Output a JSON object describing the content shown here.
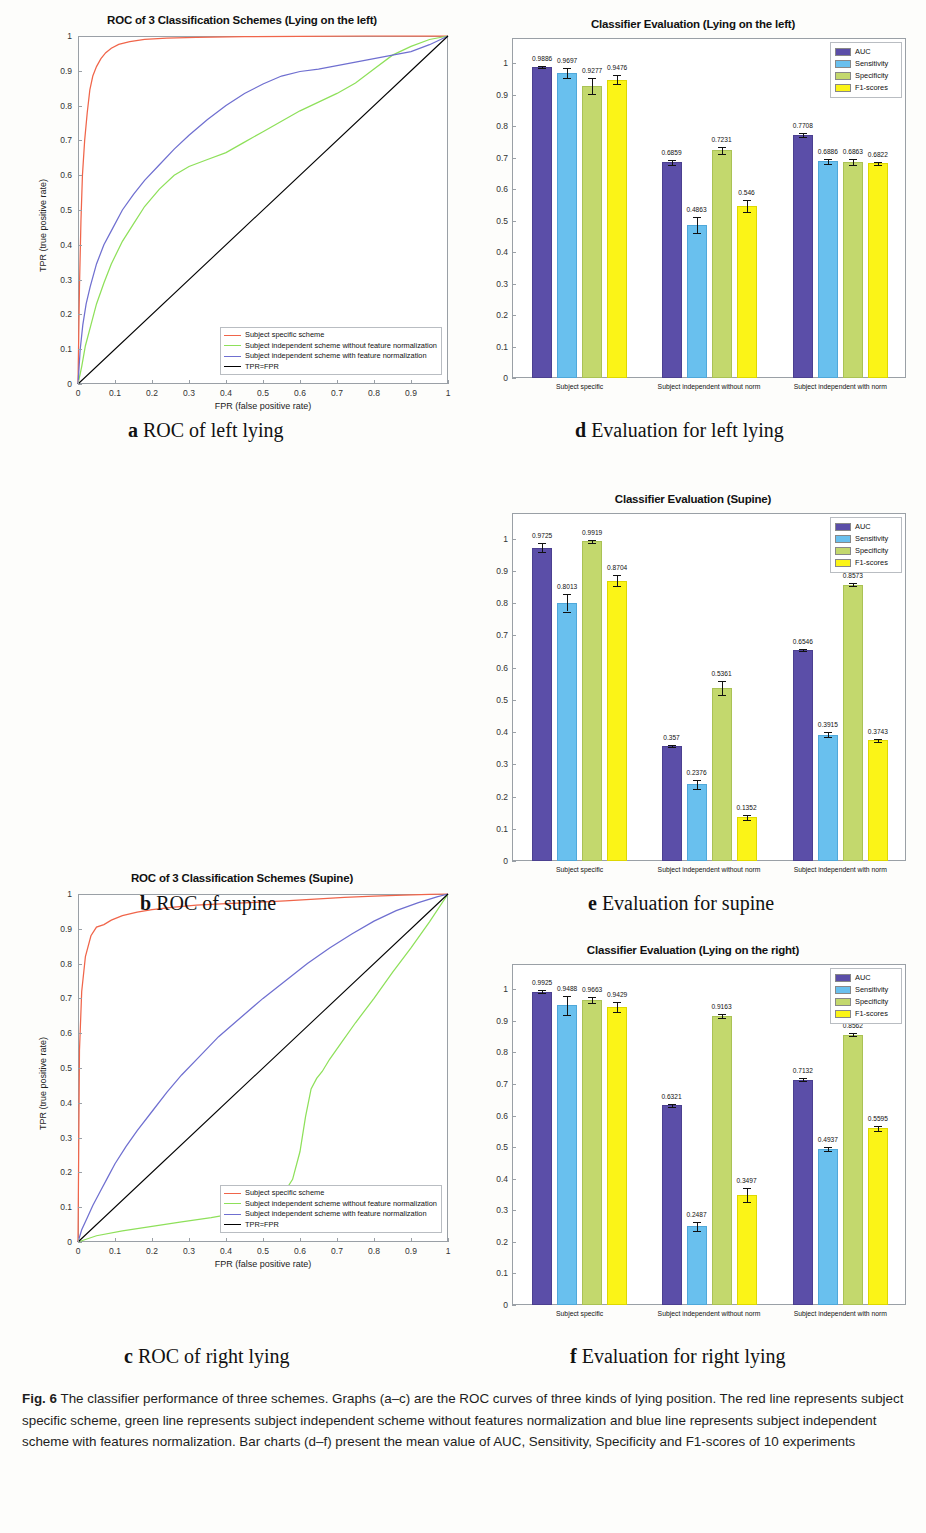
{
  "figure": {
    "caption_label": "Fig. 6",
    "caption_text": " The classifier performance of three schemes. Graphs (a–c) are the ROC curves of three kinds of lying position. The red line represents subject specific scheme, green line represents subject independent scheme without features normalization and blue line represents subject independent scheme with features normalization. Bar charts (d–f) present the mean value of AUC, Sensitivity, Specificity and F1-scores of 10 experiments"
  },
  "subcaptions": {
    "a_letter": "a",
    "a_text": " ROC of left lying",
    "b_letter": "b",
    "b_text": " ROC of supine",
    "c_letter": "c",
    "c_text": " ROC of right lying",
    "d_letter": "d",
    "d_text": " Evaluation for left lying",
    "e_letter": "e",
    "e_text": " Evaluation for supine",
    "f_letter": "f",
    "f_text": " Evaluation for right lying"
  },
  "colors": {
    "subject_specific": "#f0654a",
    "independent_without_norm": "#8ee05a",
    "independent_with_norm": "#6f6fd0",
    "diagonal": "#000000",
    "auc": "#5b4ea8",
    "sensitivity": "#69c0ee",
    "specificity": "#c3d86d",
    "f1": "#fbf417"
  },
  "roc_common": {
    "xlabel": "FPR (false positive rate)",
    "ylabel": "TPR (true positive rate)",
    "xticks": [
      "0",
      "0.1",
      "0.2",
      "0.3",
      "0.4",
      "0.5",
      "0.6",
      "0.7",
      "0.8",
      "0.9",
      "1"
    ],
    "yticks": [
      "0",
      "0.1",
      "0.2",
      "0.3",
      "0.4",
      "0.5",
      "0.6",
      "0.7",
      "0.8",
      "0.9",
      "1"
    ],
    "legend": [
      {
        "label": "Subject specific scheme",
        "color": "#f0654a"
      },
      {
        "label": "Subject independent scheme without feature normalization",
        "color": "#8ee05a"
      },
      {
        "label": "Subject independent scheme with feature normalization",
        "color": "#6f6fd0"
      },
      {
        "label": "TPR=FPR",
        "color": "#000000"
      }
    ]
  },
  "bar_common": {
    "yticks": [
      "0",
      "0.1",
      "0.2",
      "0.3",
      "0.4",
      "0.5",
      "0.6",
      "0.7",
      "0.8",
      "0.9",
      "1"
    ],
    "groups": [
      "Subject specific",
      "Subject independent without norm",
      "Subject independent with norm"
    ],
    "legend": [
      {
        "label": "AUC",
        "color": "#5b4ea8"
      },
      {
        "label": "Sensitivity",
        "color": "#69c0ee"
      },
      {
        "label": "Specificity",
        "color": "#c3d86d"
      },
      {
        "label": "F1-scores",
        "color": "#fbf417"
      }
    ]
  },
  "chart_data": [
    {
      "id": "a",
      "type": "line",
      "title": "ROC of 3 Classification Schemes (Lying on the left)",
      "xlabel": "FPR (false positive rate)",
      "ylabel": "TPR (true positive rate)",
      "xlim": [
        0,
        1
      ],
      "ylim": [
        0,
        1
      ],
      "grid": false,
      "legend_position": "bottom-right",
      "series": [
        {
          "name": "Subject specific scheme",
          "color": "#f0654a",
          "x": [
            0,
            0.004,
            0.008,
            0.012,
            0.018,
            0.025,
            0.032,
            0.04,
            0.05,
            0.062,
            0.075,
            0.09,
            0.11,
            0.14,
            0.18,
            0.24,
            0.32,
            0.45,
            0.6,
            0.78,
            1.0
          ],
          "y": [
            0,
            0.28,
            0.47,
            0.6,
            0.7,
            0.78,
            0.845,
            0.885,
            0.912,
            0.935,
            0.952,
            0.965,
            0.976,
            0.984,
            0.99,
            0.994,
            0.996,
            0.998,
            0.999,
            1.0,
            1.0
          ]
        },
        {
          "name": "Subject independent scheme without feature normalization",
          "color": "#8ee05a",
          "x": [
            0,
            0.01,
            0.02,
            0.035,
            0.05,
            0.07,
            0.09,
            0.12,
            0.15,
            0.18,
            0.22,
            0.26,
            0.3,
            0.35,
            0.4,
            0.45,
            0.5,
            0.55,
            0.6,
            0.65,
            0.7,
            0.75,
            0.8,
            0.85,
            0.9,
            0.95,
            1.0
          ],
          "y": [
            0,
            0.05,
            0.11,
            0.17,
            0.23,
            0.29,
            0.345,
            0.41,
            0.46,
            0.51,
            0.56,
            0.6,
            0.625,
            0.645,
            0.665,
            0.695,
            0.725,
            0.755,
            0.785,
            0.81,
            0.835,
            0.865,
            0.905,
            0.945,
            0.97,
            0.99,
            1.0
          ]
        },
        {
          "name": "Subject independent scheme with feature normalization",
          "color": "#6f6fd0",
          "x": [
            0,
            0.006,
            0.013,
            0.022,
            0.033,
            0.05,
            0.07,
            0.09,
            0.12,
            0.15,
            0.18,
            0.22,
            0.26,
            0.3,
            0.35,
            0.4,
            0.45,
            0.5,
            0.55,
            0.6,
            0.65,
            0.7,
            0.75,
            0.8,
            0.85,
            0.9,
            0.95,
            1.0
          ],
          "y": [
            0,
            0.1,
            0.17,
            0.23,
            0.28,
            0.345,
            0.4,
            0.44,
            0.5,
            0.545,
            0.585,
            0.63,
            0.675,
            0.715,
            0.76,
            0.8,
            0.835,
            0.862,
            0.885,
            0.898,
            0.905,
            0.915,
            0.925,
            0.935,
            0.945,
            0.955,
            0.975,
            1.0
          ]
        },
        {
          "name": "TPR=FPR",
          "color": "#000000",
          "x": [
            0,
            1
          ],
          "y": [
            0,
            1
          ]
        }
      ]
    },
    {
      "id": "b",
      "type": "line",
      "title": "ROC of 3 Classification Schemes (Supine)",
      "xlabel": "FPR (false positive rate)",
      "ylabel": "TPR (true positive rate)",
      "xlim": [
        0,
        1
      ],
      "ylim": [
        0,
        1
      ],
      "grid": false,
      "legend_position": "bottom-right",
      "series": [
        {
          "name": "Subject specific scheme",
          "color": "#f0654a",
          "x": [
            0,
            0.004,
            0.01,
            0.02,
            0.035,
            0.05,
            0.07,
            0.09,
            0.12,
            0.16,
            0.2,
            0.26,
            0.32,
            0.4,
            0.48,
            0.56,
            0.64,
            0.72,
            0.8,
            0.88,
            0.95,
            1.0
          ],
          "y": [
            0,
            0.55,
            0.72,
            0.82,
            0.88,
            0.905,
            0.912,
            0.925,
            0.938,
            0.948,
            0.955,
            0.962,
            0.968,
            0.972,
            0.976,
            0.98,
            0.985,
            0.99,
            0.994,
            0.997,
            0.999,
            1.0
          ]
        },
        {
          "name": "Subject independent scheme without feature normalization",
          "color": "#8ee05a",
          "x": [
            0,
            0.05,
            0.12,
            0.2,
            0.28,
            0.36,
            0.44,
            0.5,
            0.55,
            0.58,
            0.6,
            0.615,
            0.63,
            0.645,
            0.66,
            0.68,
            0.71,
            0.75,
            0.8,
            0.85,
            0.9,
            0.95,
            1.0
          ],
          "y": [
            0,
            0.018,
            0.032,
            0.045,
            0.058,
            0.07,
            0.085,
            0.1,
            0.13,
            0.18,
            0.26,
            0.36,
            0.44,
            0.47,
            0.49,
            0.525,
            0.57,
            0.63,
            0.7,
            0.775,
            0.845,
            0.92,
            1.0
          ]
        },
        {
          "name": "Subject independent scheme with feature normalization",
          "color": "#6f6fd0",
          "x": [
            0,
            0.01,
            0.025,
            0.04,
            0.06,
            0.08,
            0.1,
            0.13,
            0.16,
            0.2,
            0.24,
            0.28,
            0.33,
            0.38,
            0.44,
            0.5,
            0.56,
            0.62,
            0.68,
            0.74,
            0.8,
            0.86,
            0.92,
            0.97,
            1.0
          ],
          "y": [
            0,
            0.035,
            0.07,
            0.105,
            0.145,
            0.185,
            0.225,
            0.275,
            0.32,
            0.375,
            0.43,
            0.48,
            0.535,
            0.59,
            0.645,
            0.7,
            0.75,
            0.8,
            0.845,
            0.885,
            0.922,
            0.952,
            0.975,
            0.992,
            1.0
          ]
        },
        {
          "name": "TPR=FPR",
          "color": "#000000",
          "x": [
            0,
            1
          ],
          "y": [
            0,
            1
          ]
        }
      ]
    },
    {
      "id": "c",
      "type": "line",
      "title": "ROC of 3 Classification schemes (lying on the right)",
      "xlabel": "FPR (false positive rate)",
      "ylabel": "TPR (true positive rate)",
      "xlim": [
        0,
        1
      ],
      "ylim": [
        0,
        1
      ],
      "grid": false,
      "legend_position": "bottom-right",
      "series": [
        {
          "name": "Subject specific scheme",
          "color": "#f0654a",
          "x": [
            0,
            0.003,
            0.008,
            0.015,
            0.025,
            0.04,
            0.06,
            0.08,
            0.11,
            0.15,
            0.2,
            0.28,
            0.38,
            0.5,
            0.64,
            0.78,
            0.9,
            1.0
          ],
          "y": [
            0,
            0.42,
            0.62,
            0.75,
            0.84,
            0.9,
            0.935,
            0.955,
            0.97,
            0.98,
            0.987,
            0.992,
            0.995,
            0.997,
            0.998,
            0.999,
            1.0,
            1.0
          ]
        },
        {
          "name": "Subject independent scheme without feature normalization",
          "color": "#8ee05a",
          "x": [
            0,
            0.01,
            0.02,
            0.04,
            0.06,
            0.09,
            0.12,
            0.16,
            0.2,
            0.25,
            0.3,
            0.35,
            0.4,
            0.45,
            0.5,
            0.55,
            0.6,
            0.65,
            0.7,
            0.74,
            0.78,
            0.8,
            0.82,
            0.85,
            0.88,
            0.92,
            0.96,
            1.0
          ],
          "y": [
            0,
            0.06,
            0.11,
            0.17,
            0.22,
            0.27,
            0.315,
            0.355,
            0.4,
            0.44,
            0.47,
            0.495,
            0.52,
            0.545,
            0.565,
            0.585,
            0.6,
            0.605,
            0.612,
            0.615,
            0.62,
            0.68,
            0.8,
            0.93,
            0.975,
            0.99,
            0.996,
            1.0
          ]
        },
        {
          "name": "Subject independent scheme with feature normalization",
          "color": "#6f6fd0",
          "x": [
            0,
            0.004,
            0.01,
            0.018,
            0.03,
            0.045,
            0.06,
            0.08,
            0.1,
            0.13,
            0.17,
            0.21,
            0.26,
            0.31,
            0.36,
            0.41,
            0.46,
            0.51,
            0.56,
            0.61,
            0.66,
            0.7,
            0.75,
            0.8,
            0.85,
            0.9,
            0.95,
            1.0
          ],
          "y": [
            0,
            0.16,
            0.26,
            0.33,
            0.39,
            0.425,
            0.445,
            0.462,
            0.475,
            0.492,
            0.512,
            0.532,
            0.552,
            0.572,
            0.59,
            0.602,
            0.608,
            0.612,
            0.615,
            0.618,
            0.62,
            0.645,
            0.7,
            0.77,
            0.84,
            0.9,
            0.955,
            1.0
          ]
        },
        {
          "name": "TPR=FPR",
          "color": "#000000",
          "x": [
            0,
            1
          ],
          "y": [
            0,
            1
          ]
        }
      ]
    },
    {
      "id": "d",
      "type": "bar",
      "title": "Classifier Evaluation (Lying on the left)",
      "xlabel": "",
      "ylabel": "",
      "ylim": [
        0,
        1.08
      ],
      "grid": false,
      "legend_position": "top-right",
      "categories": [
        "Subject specific",
        "Subject independent without norm",
        "Subject independent with norm"
      ],
      "series": [
        {
          "name": "AUC",
          "color": "#5b4ea8",
          "values": [
            0.9886,
            0.6859,
            0.7708
          ],
          "errors": [
            0.004,
            0.008,
            0.006
          ]
        },
        {
          "name": "Sensitivity",
          "color": "#69c0ee",
          "values": [
            0.9697,
            0.4863,
            0.6886
          ],
          "errors": [
            0.016,
            0.026,
            0.008
          ]
        },
        {
          "name": "Specificity",
          "color": "#c3d86d",
          "values": [
            0.9277,
            0.7231,
            0.6863
          ],
          "errors": [
            0.024,
            0.012,
            0.01
          ]
        },
        {
          "name": "F1-scores",
          "color": "#fbf417",
          "values": [
            0.9476,
            0.546,
            0.6822
          ],
          "errors": [
            0.014,
            0.02,
            0.005
          ]
        }
      ],
      "bar_labels": [
        [
          "0.9886",
          "0.9697",
          "0.9277",
          "0.9476"
        ],
        [
          "0.6859",
          "0.4863",
          "0.7231",
          "0.546"
        ],
        [
          "0.7708",
          "0.6886",
          "0.6863",
          "0.6822"
        ]
      ]
    },
    {
      "id": "e",
      "type": "bar",
      "title": "Classifier Evaluation (Supine)",
      "xlabel": "",
      "ylabel": "",
      "ylim": [
        0,
        1.08
      ],
      "grid": false,
      "legend_position": "top-right",
      "categories": [
        "Subject specific",
        "Subject independent without norm",
        "Subject independent with norm"
      ],
      "series": [
        {
          "name": "AUC",
          "color": "#5b4ea8",
          "values": [
            0.9725,
            0.357,
            0.6546
          ],
          "errors": [
            0.013,
            0.004,
            0.004
          ]
        },
        {
          "name": "Sensitivity",
          "color": "#69c0ee",
          "values": [
            0.8013,
            0.2376,
            0.3915
          ],
          "errors": [
            0.027,
            0.013,
            0.008
          ]
        },
        {
          "name": "Specificity",
          "color": "#c3d86d",
          "values": [
            0.9919,
            0.5361,
            0.8573
          ],
          "errors": [
            0.004,
            0.022,
            0.004
          ]
        },
        {
          "name": "F1-scores",
          "color": "#fbf417",
          "values": [
            0.8704,
            0.1352,
            0.3743
          ],
          "errors": [
            0.018,
            0.008,
            0.004
          ]
        }
      ],
      "bar_labels": [
        [
          "0.9725",
          "0.8013",
          "0.9919",
          "0.8704"
        ],
        [
          "0.357",
          "0.2376",
          "0.5361",
          "0.1352"
        ],
        [
          "0.6546",
          "0.3915",
          "0.8573",
          "0.3743"
        ]
      ]
    },
    {
      "id": "f",
      "type": "bar",
      "title": "Classifier Evaluation (Lying on the right)",
      "xlabel": "",
      "ylabel": "",
      "ylim": [
        0,
        1.08
      ],
      "grid": false,
      "legend_position": "top-right",
      "categories": [
        "Subject specific",
        "Subject independent without norm",
        "Subject independent with norm"
      ],
      "series": [
        {
          "name": "AUC",
          "color": "#5b4ea8",
          "values": [
            0.9925,
            0.6321,
            0.7132
          ],
          "errors": [
            0.004,
            0.005,
            0.005
          ]
        },
        {
          "name": "Sensitivity",
          "color": "#69c0ee",
          "values": [
            0.9488,
            0.2487,
            0.4937
          ],
          "errors": [
            0.03,
            0.013,
            0.006
          ]
        },
        {
          "name": "Specificity",
          "color": "#c3d86d",
          "values": [
            0.9663,
            0.9163,
            0.8562
          ],
          "errors": [
            0.01,
            0.006,
            0.005
          ]
        },
        {
          "name": "F1-scores",
          "color": "#fbf417",
          "values": [
            0.9429,
            0.3497,
            0.5595
          ],
          "errors": [
            0.016,
            0.022,
            0.009
          ]
        }
      ],
      "bar_labels": [
        [
          "0.9925",
          "0.9488",
          "0.9663",
          "0.9429"
        ],
        [
          "0.6321",
          "0.2487",
          "0.9163",
          "0.3497"
        ],
        [
          "0.7132",
          "0.4937",
          "0.8562",
          "0.5595"
        ]
      ]
    }
  ]
}
